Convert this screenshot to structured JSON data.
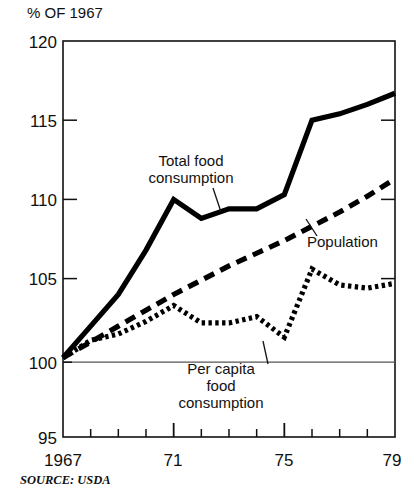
{
  "chart_data": {
    "type": "line",
    "title": "",
    "ylabel": "% OF 1967",
    "xlabel": "",
    "ylim": [
      95,
      120
    ],
    "xlim": [
      1967,
      1979
    ],
    "yticks": [
      120,
      115,
      110,
      105,
      100,
      95
    ],
    "ytick_labels": [
      "120",
      "115",
      "110",
      "105",
      "100",
      "95"
    ],
    "x": [
      1967,
      1968,
      1969,
      1970,
      1971,
      1972,
      1973,
      1974,
      1975,
      1976,
      1977,
      1978,
      1979
    ],
    "xtick_values": [
      1967,
      1968,
      1969,
      1970,
      1971,
      1972,
      1973,
      1974,
      1975,
      1976,
      1977,
      1978,
      1979
    ],
    "xtick_labels": [
      "1967",
      "",
      "",
      "",
      "71",
      "",
      "",
      "",
      "75",
      "",
      "",
      "",
      "79"
    ],
    "major_xticks": [
      1967,
      1971,
      1975,
      1979
    ],
    "grid": "gridline at 100 only",
    "legend_position": "inline annotations",
    "series": [
      {
        "name": "Total food consumption",
        "style": "solid",
        "values": [
          100.0,
          102.0,
          104.0,
          106.8,
          110.0,
          108.8,
          109.4,
          109.4,
          110.3,
          115.0,
          115.4,
          116.0,
          116.7
        ]
      },
      {
        "name": "Population",
        "style": "dashed",
        "values": [
          100.0,
          101.0,
          102.0,
          103.0,
          104.0,
          104.9,
          105.8,
          106.6,
          107.4,
          108.3,
          109.2,
          110.2,
          111.3
        ]
      },
      {
        "name": "Per capita food consumption",
        "style": "dotted",
        "values": [
          100.0,
          101.1,
          101.5,
          102.3,
          103.3,
          102.2,
          102.2,
          102.6,
          101.3,
          105.6,
          104.6,
          104.4,
          104.7
        ]
      }
    ],
    "annotations": [
      {
        "text_lines": [
          "Total food",
          "consumption"
        ],
        "target_series": "Total food consumption"
      },
      {
        "text_lines": [
          "Population"
        ],
        "target_series": "Population"
      },
      {
        "text_lines": [
          "Per capita",
          "food",
          "consumption"
        ],
        "target_series": "Per capita food consumption"
      }
    ],
    "source": "SOURCE: USDA"
  },
  "labels": {
    "y_axis_title": "% OF 1967",
    "ytick_0": "120",
    "ytick_1": "115",
    "ytick_2": "110",
    "ytick_3": "105",
    "ytick_4": "100",
    "ytick_5": "95",
    "xtick_0": "1967",
    "xtick_1": "71",
    "xtick_2": "75",
    "xtick_3": "79",
    "annotation_total_line1": "Total food",
    "annotation_total_line2": "consumption",
    "annotation_population": "Population",
    "annotation_percap_line1": "Per capita",
    "annotation_percap_line2": "food",
    "annotation_percap_line3": "consumption",
    "source": "SOURCE: USDA"
  }
}
